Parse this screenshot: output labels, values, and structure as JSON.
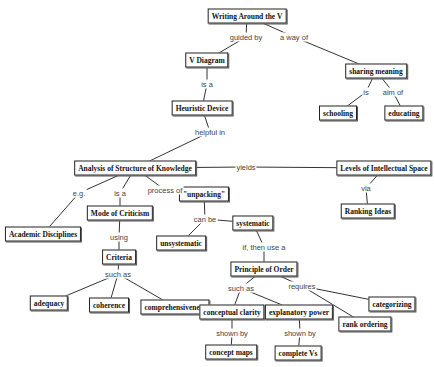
{
  "diagram": {
    "type": "concept-map",
    "nodes": [
      {
        "id": "writing",
        "label": "Writing Around the V"
      },
      {
        "id": "vdiagram",
        "label": "V Diagram"
      },
      {
        "id": "sharing",
        "label": "sharing meaning"
      },
      {
        "id": "schooling",
        "label": "schooling"
      },
      {
        "id": "educating",
        "label": "educating"
      },
      {
        "id": "heuristic",
        "label": "Heuristic Device"
      },
      {
        "id": "analysis",
        "label": "Analysis of Structure of Knowledge"
      },
      {
        "id": "levels",
        "label": "Levels of  Intellectual Space"
      },
      {
        "id": "ranking",
        "label": "Ranking Ideas"
      },
      {
        "id": "academic",
        "label": "Academic Disciplines"
      },
      {
        "id": "mode",
        "label": "Mode of Criticism"
      },
      {
        "id": "unpacking",
        "label": "\"unpacking\""
      },
      {
        "id": "systematic",
        "label": "systematic"
      },
      {
        "id": "unsystematic",
        "label": "unsystematic"
      },
      {
        "id": "criteria",
        "label": "Criteria"
      },
      {
        "id": "adequacy",
        "label": "adequacy"
      },
      {
        "id": "coherence",
        "label": "coherence"
      },
      {
        "id": "comprehensiveness",
        "label": "comprehensiveness"
      },
      {
        "id": "principle",
        "label": "Principle of Order"
      },
      {
        "id": "conceptual",
        "label": "conceptual clarity"
      },
      {
        "id": "explanatory",
        "label": "explanatory power"
      },
      {
        "id": "categorizing",
        "label": "categorizing"
      },
      {
        "id": "rankordering",
        "label": "rank ordering"
      },
      {
        "id": "conceptmaps",
        "label": "concept maps"
      },
      {
        "id": "completevs",
        "label": "complete Vs"
      }
    ],
    "links": [
      {
        "id": "guided",
        "label": "guided by",
        "from": "writing",
        "to": [
          "vdiagram"
        ]
      },
      {
        "id": "wayof",
        "label": "a way of",
        "from": "writing",
        "to": [
          "sharing"
        ]
      },
      {
        "id": "is",
        "label": "is",
        "from": "sharing",
        "to": [
          "schooling"
        ]
      },
      {
        "id": "aimof",
        "label": "aim of",
        "from": "sharing",
        "to": [
          "educating"
        ]
      },
      {
        "id": "isa1",
        "label": "is a",
        "from": "vdiagram",
        "to": [
          "heuristic"
        ]
      },
      {
        "id": "helpful",
        "label": "helpful in",
        "from": "heuristic",
        "to": [
          "analysis"
        ]
      },
      {
        "id": "yields",
        "label": "yields",
        "from": "analysis",
        "to": [
          "levels"
        ]
      },
      {
        "id": "via",
        "label": "via",
        "from": "levels",
        "to": [
          "ranking"
        ]
      },
      {
        "id": "eg",
        "label": "e.g.",
        "from": "analysis",
        "to": [
          "academic"
        ]
      },
      {
        "id": "isa2",
        "label": "is a",
        "from": "analysis",
        "to": [
          "mode"
        ]
      },
      {
        "id": "processof",
        "label": "process of",
        "from": "analysis",
        "to": [
          "unpacking"
        ]
      },
      {
        "id": "using",
        "label": "using",
        "from": "mode",
        "to": [
          "criteria"
        ]
      },
      {
        "id": "canbe",
        "label": "can be",
        "from": "unpacking",
        "to": [
          "systematic",
          "unsystematic"
        ]
      },
      {
        "id": "suchas1",
        "label": "such as",
        "from": "criteria",
        "to": [
          "adequacy",
          "coherence",
          "comprehensiveness"
        ]
      },
      {
        "id": "ifthen",
        "label": "if, then use a",
        "from": "systematic",
        "to": [
          "principle"
        ]
      },
      {
        "id": "suchas2",
        "label": "such as",
        "from": "principle",
        "to": [
          "conceptual",
          "explanatory"
        ]
      },
      {
        "id": "requires",
        "label": "requires",
        "from": "principle",
        "to": [
          "categorizing",
          "rankordering"
        ]
      },
      {
        "id": "shownby1",
        "label": "shown by",
        "from": "conceptual",
        "to": [
          "conceptmaps"
        ]
      },
      {
        "id": "shownby2",
        "label": "shown by",
        "from": "explanatory",
        "to": [
          "completevs"
        ]
      }
    ]
  }
}
